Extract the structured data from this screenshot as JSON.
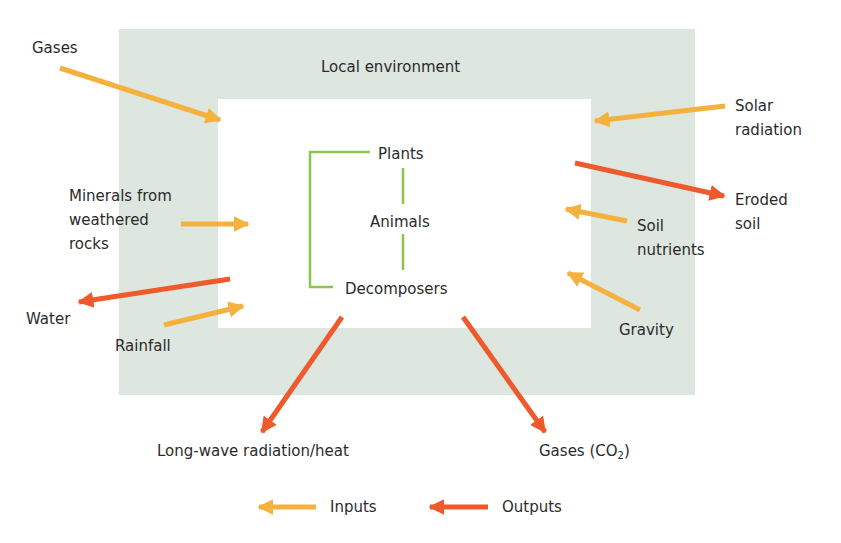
{
  "diagram": {
    "title": "Local environment",
    "colors": {
      "environment_fill": "#dde6df",
      "inner_fill": "#ffffff",
      "input_arrow": "#f5b13e",
      "output_arrow": "#ee5a2b",
      "food_chain_line": "#8dc450",
      "text": "#2b2b2b"
    },
    "food_chain": {
      "plants": "Plants",
      "animals": "Animals",
      "decomposers": "Decomposers"
    },
    "inputs": {
      "gases": "Gases",
      "minerals_line1": "Minerals from",
      "minerals_line2": "weathered",
      "minerals_line3": "rocks",
      "rainfall": "Rainfall",
      "solar_line1": "Solar",
      "solar_line2": "radiation",
      "soil_nutrients_line1": "Soil",
      "soil_nutrients_line2": "nutrients",
      "gravity": "Gravity"
    },
    "outputs": {
      "water": "Water",
      "eroded_line1": "Eroded",
      "eroded_line2": "soil",
      "longwave": "Long-wave radiation/heat",
      "gases_co2_prefix": "Gases (CO",
      "gases_co2_sub": "2",
      "gases_co2_suffix": ")"
    },
    "legend": {
      "inputs": "Inputs",
      "outputs": "Outputs"
    }
  }
}
